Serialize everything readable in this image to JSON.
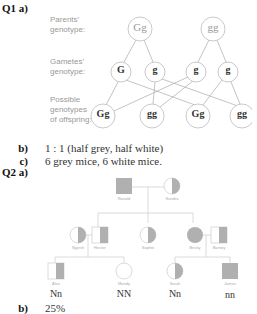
{
  "q1": {
    "label": "Q1 a)",
    "row_labels": {
      "parents": [
        "Parents'",
        "genotype:"
      ],
      "gametes": [
        "Gametes'",
        "genotype:"
      ],
      "offspring": [
        "Possible",
        "genotypes",
        "of offspring:"
      ]
    },
    "parents": [
      "Gg",
      "gg"
    ],
    "gametes": [
      "G",
      "g",
      "g",
      "g"
    ],
    "offspring": [
      "Gg",
      "gg",
      "Gg",
      "gg"
    ],
    "b_label": "b)",
    "b_answer": "1 : 1 (half grey, half white)",
    "c_label": "c)",
    "c_answer": "6 grey mice, 6 white mice."
  },
  "q2": {
    "label": "Q2 a)",
    "pedigree": {
      "generation1": [
        {
          "name": "Ronald",
          "sex": "male",
          "status": "affected"
        },
        {
          "name": "Sandra",
          "sex": "female",
          "status": "carrier"
        }
      ],
      "generation2": [
        {
          "name": "Nyjesh",
          "sex": "female",
          "status": "carrier"
        },
        {
          "name": "Hector",
          "sex": "male",
          "status": "carrier"
        },
        {
          "name": "Sophie",
          "sex": "female",
          "status": "carrier"
        },
        {
          "name": "Becky",
          "sex": "female",
          "status": "affected"
        },
        {
          "name": "Barney",
          "sex": "male",
          "status": "carrier"
        }
      ],
      "generation3": [
        {
          "name": "Alex",
          "sex": "male",
          "status": "carrier",
          "genotype": "Nn"
        },
        {
          "name": "Mandy",
          "sex": "female",
          "status": "unaffected",
          "genotype": "NN"
        },
        {
          "name": "Sarah",
          "sex": "female",
          "status": "carrier",
          "genotype": "Nn"
        },
        {
          "name": "James",
          "sex": "male",
          "status": "affected",
          "genotype": "nn"
        }
      ]
    },
    "b_label": "b)",
    "b_answer": "25%"
  },
  "colors": {
    "line": "#aaaaaa",
    "fill": "#b0b0b0",
    "circle_stroke": "#999999"
  }
}
